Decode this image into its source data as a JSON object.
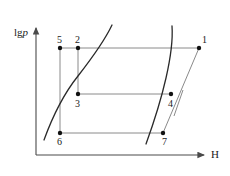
{
  "figure": {
    "type": "line-diagram",
    "background_color": "#ffffff",
    "axes": {
      "y_axis": {
        "label_prefix": "lg",
        "label_italic": "p",
        "label_full": "lgp",
        "origin_x": 36,
        "top_y": 26,
        "bottom_y": 155,
        "arrow": "up"
      },
      "x_axis": {
        "label": "H",
        "label_italic": true,
        "left_x": 36,
        "right_x": 206,
        "y": 155,
        "arrow": "right"
      },
      "axis_color": "#4a4a4a",
      "line_color": "#8a8a8a",
      "curve_color": "#2a2a2a",
      "point_color": "#111111"
    },
    "points": [
      {
        "id": "1",
        "label": "1",
        "x": 199,
        "y": 48,
        "label_dx": 3,
        "label_dy": -13
      },
      {
        "id": "2",
        "label": "2",
        "x": 78,
        "y": 48,
        "label_dx": -3,
        "label_dy": -13
      },
      {
        "id": "3",
        "label": "3",
        "x": 78,
        "y": 94,
        "label_dx": -3,
        "label_dy": 5
      },
      {
        "id": "4",
        "label": "4",
        "x": 171,
        "y": 94,
        "label_dx": -3,
        "label_dy": 5
      },
      {
        "id": "5",
        "label": "5",
        "x": 60,
        "y": 48,
        "label_dx": -3,
        "label_dy": -13
      },
      {
        "id": "6",
        "label": "6",
        "x": 60,
        "y": 133,
        "label_dx": -3,
        "label_dy": 4
      },
      {
        "id": "7",
        "label": "7",
        "x": 163,
        "y": 133,
        "label_dx": -1,
        "label_dy": 4
      }
    ],
    "segments": [
      {
        "name": "line-5-2-1",
        "from": [
          60,
          48
        ],
        "to": [
          199,
          48
        ]
      },
      {
        "name": "line-3-4",
        "from": [
          78,
          94
        ],
        "to": [
          171,
          94
        ]
      },
      {
        "name": "line-6-7",
        "from": [
          60,
          133
        ],
        "to": [
          163,
          133
        ]
      },
      {
        "name": "line-5-6",
        "from": [
          60,
          48
        ],
        "to": [
          60,
          133
        ]
      },
      {
        "name": "line-2-3",
        "from": [
          78,
          48
        ],
        "to": [
          78,
          94
        ]
      },
      {
        "name": "line-7-4-1",
        "from": [
          163,
          133
        ],
        "to": [
          199,
          48
        ]
      },
      {
        "name": "line-short-parallel",
        "from": [
          174,
          116
        ],
        "to": [
          183,
          90
        ]
      }
    ],
    "curves": [
      {
        "name": "left-isotherm-curve",
        "path": "M 44,140 C 52,118 62,96 78,76 C 92,58 104,42 112,25"
      },
      {
        "name": "right-isotherm-curve",
        "path": "M 146,144 C 154,122 161,100 166,78 C 171,56 173,40 172,26"
      }
    ]
  }
}
